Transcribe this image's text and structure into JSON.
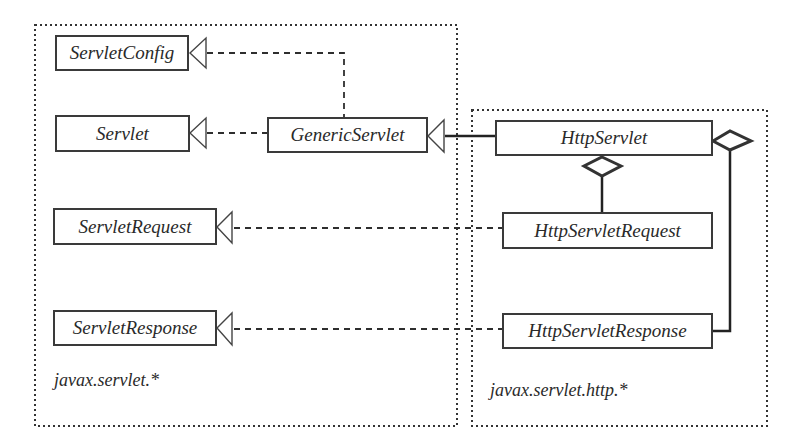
{
  "diagram": {
    "type": "uml-class-diagram",
    "packages": [
      {
        "id": "pkg-servlet",
        "label": "javax.servlet.*"
      },
      {
        "id": "pkg-http",
        "label": "javax.servlet.http.*"
      }
    ],
    "classes": {
      "servlet_config": "ServletConfig",
      "servlet": "Servlet",
      "generic_servlet": "GenericServlet",
      "servlet_request": "ServletRequest",
      "servlet_response": "ServletResponse",
      "http_servlet": "HttpServlet",
      "http_servlet_request": "HttpServletRequest",
      "http_servlet_response": "HttpServletResponse"
    },
    "relationships": [
      {
        "from": "GenericServlet",
        "to": "ServletConfig",
        "kind": "realization"
      },
      {
        "from": "GenericServlet",
        "to": "Servlet",
        "kind": "realization"
      },
      {
        "from": "HttpServlet",
        "to": "GenericServlet",
        "kind": "generalization"
      },
      {
        "from": "HttpServletRequest",
        "to": "ServletRequest",
        "kind": "realization"
      },
      {
        "from": "HttpServletResponse",
        "to": "ServletResponse",
        "kind": "realization"
      },
      {
        "from": "HttpServlet",
        "to": "HttpServletRequest",
        "kind": "aggregation"
      },
      {
        "from": "HttpServlet",
        "to": "HttpServletResponse",
        "kind": "aggregation"
      }
    ],
    "colors": {
      "line": "#2e2e2e",
      "box_border": "#3a3a3a",
      "text": "#2a2a2a",
      "background": "#ffffff"
    }
  }
}
